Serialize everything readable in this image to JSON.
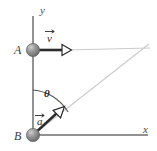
{
  "figure": {
    "type": "physics-kinematics-diagram",
    "width": 157,
    "height": 151,
    "background_color": "#ffffff"
  },
  "axes": {
    "y_label": "y",
    "x_label": "x",
    "color": "#6e6e6e",
    "origin": {
      "x": 33,
      "y": 135
    },
    "y_axis": {
      "x": 33,
      "y_top": 16,
      "y_bottom": 140
    },
    "x_axis": {
      "y": 135,
      "x_left": 33,
      "x_right": 148
    }
  },
  "bodies": [
    {
      "name": "A",
      "label": "A",
      "cx": 33,
      "cy": 50,
      "r": 6.5,
      "fill": "#8f8f8f",
      "highlight": "#c9c9c9",
      "label_x": 16,
      "label_y": 54
    },
    {
      "name": "B",
      "label": "B",
      "cx": 33,
      "cy": 135,
      "r": 6.5,
      "fill": "#8f8f8f",
      "highlight": "#c9c9c9",
      "label_x": 16,
      "label_y": 139
    }
  ],
  "vectors": [
    {
      "name": "velocity",
      "label": "v",
      "has_overarrow": true,
      "from": {
        "x": 33,
        "y": 50
      },
      "to": {
        "x": 68,
        "y": 50
      },
      "color": "#2b2b2b",
      "arrowhead": "open-triangle",
      "label_x": 48,
      "label_y": 41
    },
    {
      "name": "acceleration",
      "label": "a",
      "has_overarrow": true,
      "from": {
        "x": 33,
        "y": 135
      },
      "to": {
        "x": 62,
        "y": 109
      },
      "color": "#2b2b2b",
      "arrowhead": "open-triangle",
      "label_x": 39,
      "label_y": 122
    }
  ],
  "construction_lines": [
    {
      "name": "horizontal-trajectory-line",
      "from": {
        "x": 68,
        "y": 50
      },
      "to": {
        "x": 150,
        "y": 48
      },
      "color": "#cccccc"
    },
    {
      "name": "diagonal-line-of-sight",
      "from": {
        "x": 33,
        "y": 135
      },
      "to": {
        "x": 149,
        "y": 44
      },
      "color": "#cccccc"
    }
  ],
  "angle": {
    "name": "theta",
    "label": "θ",
    "vertex": {
      "x": 33,
      "y": 135
    },
    "radius": 45,
    "from_axis": "positive-y",
    "to": "diagonal-line-of-sight",
    "arc_color": "#555555",
    "label_x": 46,
    "label_y": 95
  }
}
